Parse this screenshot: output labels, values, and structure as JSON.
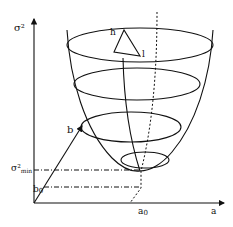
{
  "diagram": {
    "type": "paraboloid-error-surface",
    "colors": {
      "stroke": "#111111",
      "background": "#ffffff"
    },
    "labels": {
      "y_axis": "σ²",
      "x_axis": "a",
      "a0": "a",
      "a0_sub": "0",
      "b_axis": "b",
      "b0": "b",
      "b0_sub": "0",
      "sigma_min": "σ²",
      "sigma_min_sub": "min",
      "triangle_h": "h",
      "triangle_l": "l"
    }
  }
}
